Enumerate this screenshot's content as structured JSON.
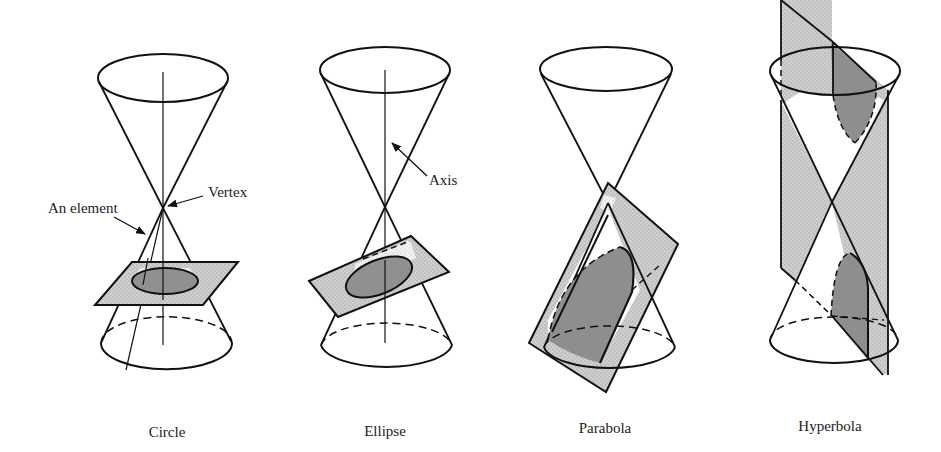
{
  "figure": {
    "colors": {
      "line": "#111111",
      "plane_fill": "#c9c9c9",
      "section_fill": "#8e8e8e",
      "background": "#ffffff"
    },
    "panels": [
      {
        "id": "circle",
        "caption": "Circle",
        "annotations": [
          "An element",
          "Vertex"
        ]
      },
      {
        "id": "ellipse",
        "caption": "Ellipse",
        "annotations": [
          "Axis"
        ]
      },
      {
        "id": "parabola",
        "caption": "Parabola",
        "annotations": []
      },
      {
        "id": "hyperbola",
        "caption": "Hyperbola",
        "annotations": []
      }
    ]
  },
  "labels": {
    "element": "An element",
    "vertex": "Vertex",
    "axis": "Axis",
    "circle": "Circle",
    "ellipse": "Ellipse",
    "parabola": "Parabola",
    "hyperbola": "Hyperbola"
  }
}
